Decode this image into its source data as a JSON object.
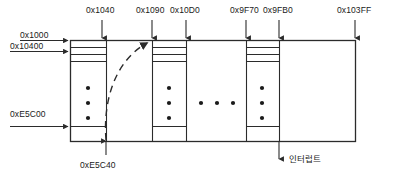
{
  "diagram": {
    "top_labels": [
      {
        "text": "0x1040",
        "x": 88,
        "y": 9,
        "arrow_x": 102,
        "arrow_y1": 19,
        "arrow_y2": 39
      },
      {
        "text": "0x1090",
        "x": 139,
        "y": 9,
        "arrow_x": 153,
        "arrow_y1": 19,
        "arrow_y2": 39
      },
      {
        "text": "0x10D0",
        "x": 172,
        "y": 9,
        "arrow_x": 186,
        "arrow_y1": 19,
        "arrow_y2": 39
      },
      {
        "text": "0x9F70",
        "x": 232,
        "y": 9,
        "arrow_x": 246,
        "arrow_y1": 19,
        "arrow_y2": 39
      },
      {
        "text": "0x9FB0",
        "x": 265,
        "y": 9,
        "arrow_x": 279,
        "arrow_y1": 19,
        "arrow_y2": 39
      },
      {
        "text": "0x103FF",
        "x": 340,
        "y": 9,
        "arrow_x": 355,
        "arrow_y1": 19,
        "arrow_y2": 39
      }
    ],
    "left_labels": [
      {
        "text": "0x1000",
        "x": 14,
        "y": 28,
        "arrow_y": 40,
        "arrow_x1": 14,
        "arrow_x2": 68
      },
      {
        "text": "0x10400",
        "x": 8,
        "y": 40,
        "arrow_y": 52,
        "arrow_x1": 8,
        "arrow_x2": 68
      },
      {
        "text": "0xE5C00",
        "x": 8,
        "y": 105,
        "arrow_y": 126,
        "arrow_x1": 8,
        "arrow_x2": 68
      }
    ],
    "bottom_labels": [
      {
        "text": "0xE5C40",
        "x": 82,
        "y": 158,
        "arrow_x": 106,
        "arrow_y1": 156,
        "arrow_y2": 140
      }
    ],
    "interrupt_label": {
      "text": "인터럽트",
      "x": 291,
      "y": 155,
      "arrow_x": 279,
      "arrow_y1": 140,
      "arrow_y2": 160
    },
    "outer_box": {
      "x": 70,
      "y": 40,
      "width": 285,
      "height": 101
    },
    "blocks": [
      {
        "name": "block-1",
        "x": 70,
        "width": 36,
        "dividers": [
          47,
          54,
          61
        ],
        "inner_bottom": 126,
        "dots": [
          {
            "x": 88,
            "y": 88
          },
          {
            "x": 88,
            "y": 103
          },
          {
            "x": 88,
            "y": 118
          }
        ]
      },
      {
        "name": "block-2",
        "x": 152,
        "width": 34,
        "dividers": [
          47,
          54,
          61
        ],
        "inner_bottom": 126,
        "dots": [
          {
            "x": 169,
            "y": 88
          },
          {
            "x": 169,
            "y": 103
          },
          {
            "x": 169,
            "y": 118
          }
        ]
      },
      {
        "name": "block-3",
        "x": 246,
        "width": 33,
        "dividers": [
          47,
          54,
          61
        ],
        "inner_bottom": 126,
        "dots": [
          {
            "x": 262,
            "y": 88
          },
          {
            "x": 262,
            "y": 103
          },
          {
            "x": 262,
            "y": 118
          }
        ]
      }
    ],
    "column_lines": [
      {
        "name": "column-line-0x1040",
        "x": 106
      },
      {
        "name": "column-line-0x1090",
        "x": 152
      },
      {
        "name": "column-line-0x10D0",
        "x": 186
      },
      {
        "name": "column-line-0x9F70",
        "x": 246
      },
      {
        "name": "column-line-0x9FB0",
        "x": 279
      }
    ],
    "ellipsis_dots": [
      {
        "x": 201,
        "y": 103
      },
      {
        "x": 217,
        "y": 103
      },
      {
        "x": 233,
        "y": 103
      }
    ],
    "dashed_curve": {
      "path": "M 106 140 C 104 104, 114 64, 149 43",
      "arrow_x": 152,
      "arrow_y": 41
    },
    "colors": {
      "stroke": "#2b2b2b",
      "text": "#1a1a1a",
      "background": "#ffffff"
    }
  }
}
